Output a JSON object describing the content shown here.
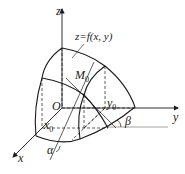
{
  "figure": {
    "labels": {
      "z_axis": "z",
      "y_axis": "y",
      "x_axis": "x",
      "origin": "O",
      "surface": "z=f(x, y)",
      "point": "M",
      "point_sub": "0",
      "x0": "x",
      "x0_sub": "0",
      "y0": "y",
      "y0_sub": "0",
      "alpha": "α",
      "beta": "β"
    },
    "colors": {
      "stroke": "#1a1a1a",
      "guide": "#8a8a8a",
      "background": "#ffffff"
    }
  }
}
